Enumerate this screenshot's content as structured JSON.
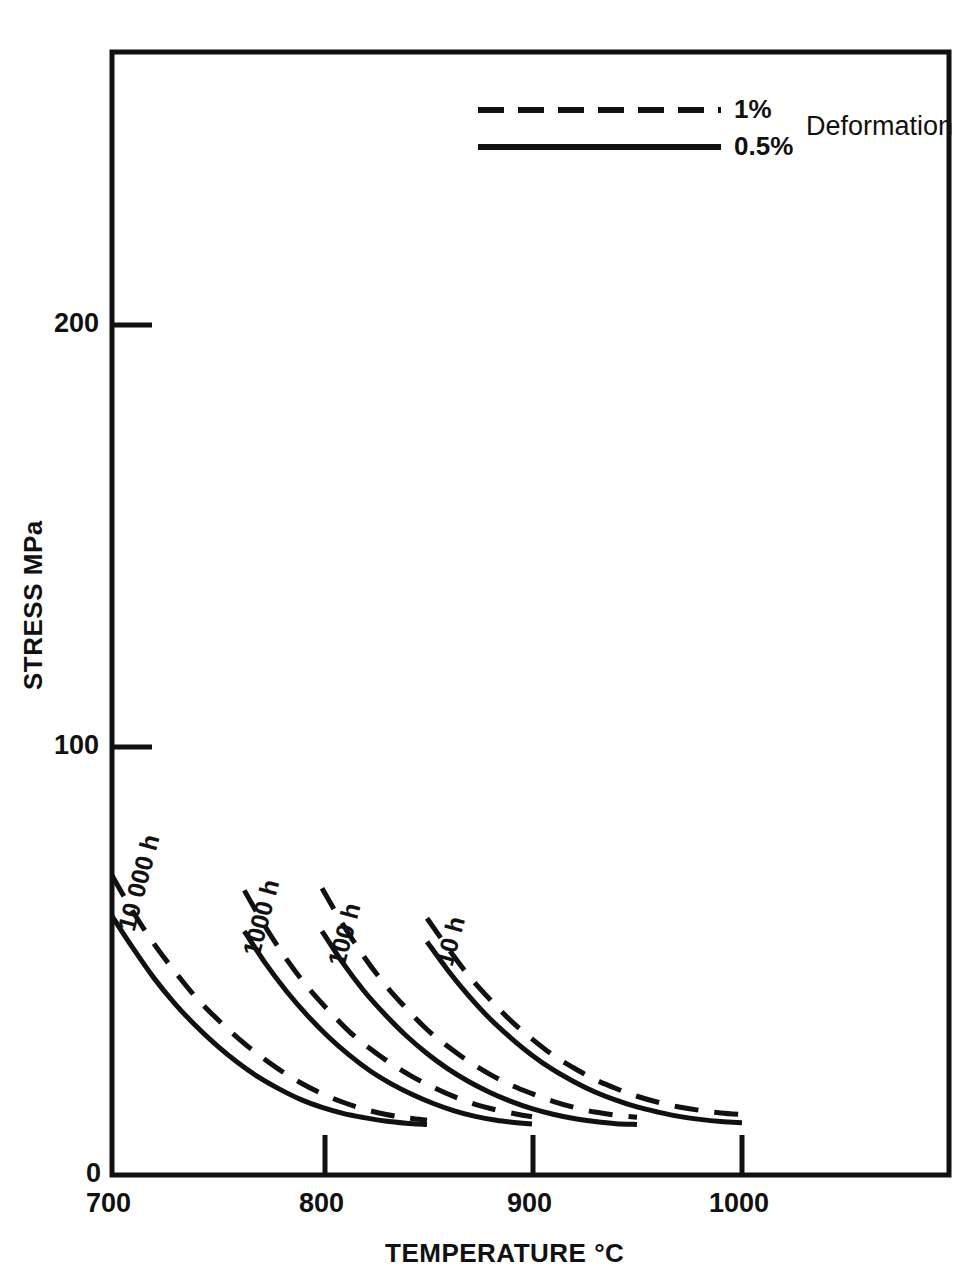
{
  "chart_data": {
    "type": "line",
    "title": "",
    "xlabel": "TEMPERATURE °C",
    "ylabel": "STRESS MPa",
    "xlim": [
      700,
      1113
    ],
    "ylim": [
      0,
      252
    ],
    "xticks": [
      700,
      800,
      900,
      1000
    ],
    "xtick_labels": [
      "700",
      "800",
      "900",
      "1000"
    ],
    "yticks": [
      0,
      100,
      200
    ],
    "ytick_labels": [
      "0",
      "100",
      "200"
    ],
    "grid": false,
    "legend_position": "top-right",
    "legend_title": "Deformation",
    "legend_entries": [
      {
        "label": "1%",
        "style": "dashed"
      },
      {
        "label": "0.5%",
        "style": "solid"
      }
    ],
    "curve_group_labels": [
      "10 000 h",
      "1000 h",
      "100 h",
      "10 h"
    ],
    "series": [
      {
        "name": "10 000 h — 1%",
        "duration": "10 000 h",
        "deformation": "1%",
        "style": "dashed",
        "points": [
          [
            700,
            70.0
          ],
          [
            710,
            61.5
          ],
          [
            720,
            54.0
          ],
          [
            730,
            47.5
          ],
          [
            740,
            41.5
          ],
          [
            750,
            36.5
          ],
          [
            760,
            32.0
          ],
          [
            770,
            28.0
          ],
          [
            780,
            24.5
          ],
          [
            790,
            21.5
          ],
          [
            800,
            19.0
          ],
          [
            810,
            17.0
          ],
          [
            820,
            15.4
          ],
          [
            830,
            14.2
          ],
          [
            840,
            13.4
          ],
          [
            850,
            12.8
          ]
        ]
      },
      {
        "name": "10 000 h — 0.5%",
        "duration": "10 000 h",
        "deformation": "0.5%",
        "style": "solid",
        "points": [
          [
            700,
            60.5
          ],
          [
            710,
            53.0
          ],
          [
            720,
            46.0
          ],
          [
            730,
            40.0
          ],
          [
            740,
            34.8
          ],
          [
            750,
            30.2
          ],
          [
            760,
            26.2
          ],
          [
            770,
            22.8
          ],
          [
            780,
            20.0
          ],
          [
            790,
            17.6
          ],
          [
            800,
            15.8
          ],
          [
            810,
            14.4
          ],
          [
            820,
            13.4
          ],
          [
            830,
            12.6
          ],
          [
            840,
            12.1
          ],
          [
            850,
            11.8
          ]
        ]
      },
      {
        "name": "1000 h — 1%",
        "duration": "1000 h",
        "deformation": "1%",
        "style": "dashed",
        "points": [
          [
            763,
            66.5
          ],
          [
            773,
            58.0
          ],
          [
            783,
            50.5
          ],
          [
            793,
            44.0
          ],
          [
            803,
            38.5
          ],
          [
            813,
            33.5
          ],
          [
            823,
            29.5
          ],
          [
            833,
            26.0
          ],
          [
            843,
            23.0
          ],
          [
            853,
            20.5
          ],
          [
            863,
            18.3
          ],
          [
            873,
            16.5
          ],
          [
            883,
            15.2
          ],
          [
            893,
            14.2
          ],
          [
            900,
            13.6
          ]
        ]
      },
      {
        "name": "1000 h — 0.5%",
        "duration": "1000 h",
        "deformation": "0.5%",
        "style": "solid",
        "points": [
          [
            763,
            57.0
          ],
          [
            773,
            49.5
          ],
          [
            783,
            43.0
          ],
          [
            793,
            37.3
          ],
          [
            803,
            32.3
          ],
          [
            813,
            28.0
          ],
          [
            823,
            24.3
          ],
          [
            833,
            21.3
          ],
          [
            843,
            18.8
          ],
          [
            853,
            16.7
          ],
          [
            863,
            15.0
          ],
          [
            873,
            13.7
          ],
          [
            883,
            12.8
          ],
          [
            893,
            12.2
          ],
          [
            900,
            11.9
          ]
        ]
      },
      {
        "name": "100 h — 1%",
        "duration": "100 h",
        "deformation": "1%",
        "style": "dashed",
        "points": [
          [
            800,
            67.0
          ],
          [
            810,
            58.5
          ],
          [
            820,
            51.0
          ],
          [
            830,
            44.5
          ],
          [
            840,
            39.0
          ],
          [
            850,
            34.0
          ],
          [
            860,
            30.0
          ],
          [
            870,
            26.5
          ],
          [
            880,
            23.5
          ],
          [
            890,
            21.0
          ],
          [
            900,
            19.0
          ],
          [
            910,
            17.2
          ],
          [
            920,
            15.8
          ],
          [
            930,
            14.7
          ],
          [
            940,
            14.0
          ],
          [
            950,
            13.5
          ]
        ]
      },
      {
        "name": "100 h — 0.5%",
        "duration": "100 h",
        "deformation": "0.5%",
        "style": "solid",
        "points": [
          [
            800,
            57.0
          ],
          [
            810,
            49.5
          ],
          [
            820,
            43.0
          ],
          [
            830,
            37.5
          ],
          [
            840,
            32.6
          ],
          [
            850,
            28.4
          ],
          [
            860,
            24.8
          ],
          [
            870,
            21.8
          ],
          [
            880,
            19.3
          ],
          [
            890,
            17.2
          ],
          [
            900,
            15.5
          ],
          [
            910,
            14.2
          ],
          [
            920,
            13.2
          ],
          [
            930,
            12.5
          ],
          [
            940,
            12.0
          ],
          [
            950,
            11.8
          ]
        ]
      },
      {
        "name": "10 h — 1%",
        "duration": "10 h",
        "deformation": "1%",
        "style": "dashed",
        "points": [
          [
            850,
            60.0
          ],
          [
            860,
            53.0
          ],
          [
            870,
            46.5
          ],
          [
            880,
            41.0
          ],
          [
            890,
            36.0
          ],
          [
            900,
            31.8
          ],
          [
            910,
            28.0
          ],
          [
            920,
            25.0
          ],
          [
            930,
            22.3
          ],
          [
            940,
            20.2
          ],
          [
            950,
            18.4
          ],
          [
            960,
            17.0
          ],
          [
            970,
            15.9
          ],
          [
            980,
            15.1
          ],
          [
            990,
            14.5
          ],
          [
            1000,
            14.1
          ]
        ]
      },
      {
        "name": "10 h — 0.5%",
        "duration": "10 h",
        "deformation": "0.5%",
        "style": "solid",
        "points": [
          [
            850,
            54.5
          ],
          [
            860,
            47.8
          ],
          [
            870,
            41.8
          ],
          [
            880,
            36.5
          ],
          [
            890,
            32.0
          ],
          [
            900,
            28.0
          ],
          [
            910,
            24.6
          ],
          [
            920,
            21.8
          ],
          [
            930,
            19.4
          ],
          [
            940,
            17.5
          ],
          [
            950,
            15.9
          ],
          [
            960,
            14.7
          ],
          [
            970,
            13.7
          ],
          [
            980,
            13.0
          ],
          [
            990,
            12.5
          ],
          [
            1000,
            12.2
          ]
        ]
      }
    ]
  },
  "axes": {
    "x_label": "TEMPERATURE °C",
    "y_label": "STRESS MPa",
    "x_ticks": [
      "700",
      "800",
      "900",
      "1000"
    ],
    "y_ticks": [
      "200",
      "100",
      "0"
    ]
  },
  "legend": {
    "dashed_label": "1%",
    "solid_label": "0.5%",
    "group_label": "Deformation"
  },
  "curve_labels": {
    "a": "10 000 h",
    "b": "1000 h",
    "c": "100 h",
    "d": "10 h"
  },
  "colors": {
    "ink": "#111111",
    "background": "#ffffff"
  }
}
